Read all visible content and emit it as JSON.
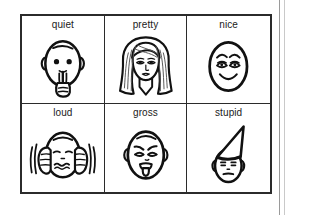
{
  "sheet": {
    "name": "emotion-word-picture-cards",
    "rows": 2,
    "columns": 3,
    "border_color": "#2b2b2b",
    "ink_color": "#111111",
    "background_color": "#ffffff"
  },
  "cells": [
    {
      "label": "quiet",
      "icon": "face-shushing-finger-to-lips-icon",
      "description": "egg-shaped face with index finger held vertically over closed lips"
    },
    {
      "label": "pretty",
      "icon": "face-woman-long-hair-icon",
      "description": "woman's face with long flowing shaded hair and v-neck collar"
    },
    {
      "label": "nice",
      "icon": "face-smiling-happy-eyes-icon",
      "description": "egg-shaped face with arched brows, half-lidded happy eyes and a broad smile"
    },
    {
      "label": "loud",
      "icon": "face-hands-covering-ears-icon",
      "description": "face with both hands pressed over the ears, motion lines, wavy grimacing mouth"
    },
    {
      "label": "gross",
      "icon": "face-tongue-out-disgust-icon",
      "description": "face with slanted brows, squeezed-shut eyes and open mouth with tongue sticking out"
    },
    {
      "label": "stupid",
      "icon": "face-dunce-cap-icon",
      "description": "face wearing a tall triangular dunce cap with a flat neutral frown"
    }
  ]
}
